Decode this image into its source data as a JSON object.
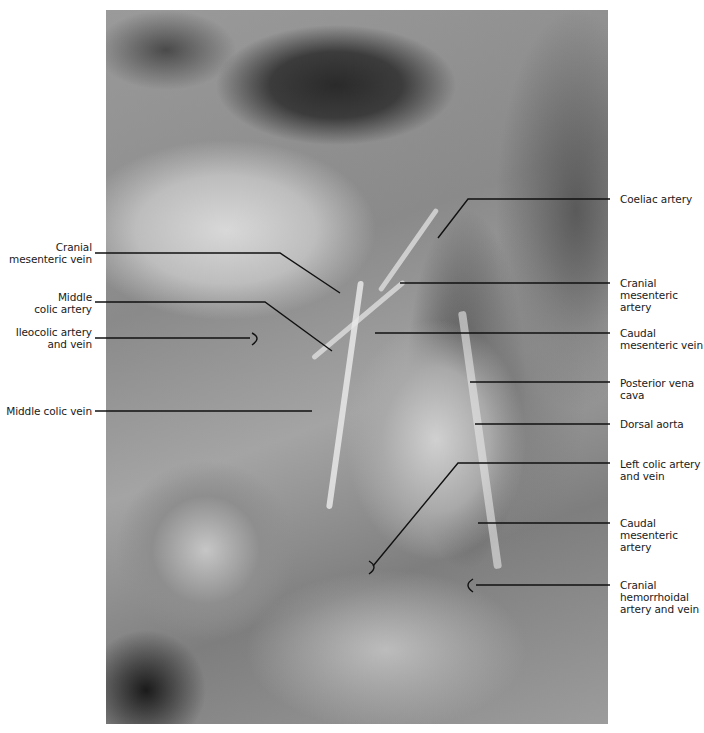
{
  "figure": {
    "labels_left": [
      {
        "id": "cranial-mesenteric-vein",
        "lines": [
          "Cranial",
          "mesenteric vein"
        ]
      },
      {
        "id": "middle-colic-artery",
        "lines": [
          "Middle",
          "colic artery"
        ]
      },
      {
        "id": "ileocolic-artery-and-vein",
        "lines": [
          "Ileocolic artery",
          "and vein"
        ]
      },
      {
        "id": "middle-colic-vein",
        "lines": [
          "Middle colic vein"
        ]
      }
    ],
    "labels_right": [
      {
        "id": "coeliac-artery",
        "lines": [
          "Coeliac artery"
        ]
      },
      {
        "id": "cranial-mesenteric-artery",
        "lines": [
          "Cranial",
          "mesenteric",
          "artery"
        ]
      },
      {
        "id": "caudal-mesenteric-vein",
        "lines": [
          "Caudal",
          "mesenteric vein"
        ]
      },
      {
        "id": "posterior-vena-cava",
        "lines": [
          "Posterior vena",
          "cava"
        ]
      },
      {
        "id": "dorsal-aorta",
        "lines": [
          "Dorsal aorta"
        ]
      },
      {
        "id": "left-colic-artery-and-vein",
        "lines": [
          "Left colic artery",
          "and vein"
        ]
      },
      {
        "id": "caudal-mesenteric-artery",
        "lines": [
          "Caudal",
          "mesenteric",
          "artery"
        ]
      },
      {
        "id": "cranial-hemorrhoidal-artery-and-vein",
        "lines": [
          "Cranial",
          "hemorrhoidal",
          "artery and vein"
        ]
      }
    ]
  }
}
